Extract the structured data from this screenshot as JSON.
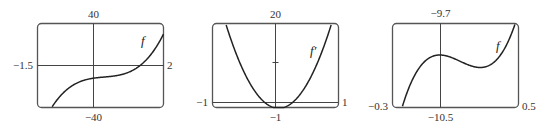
{
  "chart_data": [
    {
      "type": "line",
      "title": "",
      "series": [
        {
          "name": "f",
          "label": "f"
        }
      ],
      "xlim": [
        -1.5,
        2
      ],
      "ylim": [
        -40,
        40
      ],
      "labels": {
        "top": "40",
        "bottom": "-40",
        "left": "-1.5",
        "right": "2"
      },
      "description": "Cubic f rising from bottom-left, flattening near y≈-10 around x≈0.3, crossing the x-axis near x≈1.3, exiting at top-right"
    },
    {
      "type": "line",
      "title": "",
      "series": [
        {
          "name": "f'",
          "label": "f'"
        }
      ],
      "xlim": [
        -1,
        1
      ],
      "ylim": [
        -1,
        20
      ],
      "labels": {
        "top": "20",
        "bottom": "-1",
        "left": "-1",
        "right": "1"
      },
      "tick_marks": [
        10
      ],
      "description": "Parabola f' with its minimum near x≈0.05, y≈-1"
    },
    {
      "type": "line",
      "title": "",
      "series": [
        {
          "name": "f",
          "label": "f"
        }
      ],
      "xlim": [
        -0.3,
        0.5
      ],
      "ylim": [
        -10.5,
        -9.7
      ],
      "labels": {
        "top": "-9.7",
        "bottom": "-10.5",
        "left": "-0.3",
        "right": "0.5"
      },
      "description": "Zoomed f showing local max at x≈0 (y≈-10.0) and local min near x≈0.26 (y≈-10.12)"
    }
  ],
  "panels": [
    {
      "top": "40",
      "bottom": "−40",
      "left": "−1.5",
      "right": "2",
      "fn": "f"
    },
    {
      "top": "20",
      "bottom": "−1",
      "left": "−1",
      "right": "1",
      "fn": "f′"
    },
    {
      "top": "−9.7",
      "bottom": "−10.5",
      "left": "−0.3",
      "right": "0.5",
      "fn": "f"
    }
  ]
}
